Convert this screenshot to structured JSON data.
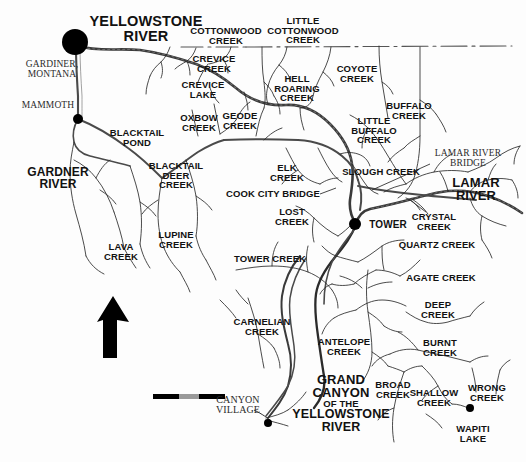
{
  "map": {
    "title": "Yellowstone River drainage map",
    "background_color": "#fdfdfd",
    "ink_color": "#111111",
    "river_color": "#333333",
    "road_color": "#555555",
    "north_arrow_label": "",
    "scale_bar": {
      "segments": [
        "#000000",
        "#9a9a9a",
        "#000000"
      ]
    },
    "places": [
      {
        "name": "gardiner-dot",
        "x": 75,
        "y": 42,
        "r": 13
      },
      {
        "name": "mammoth-dot",
        "x": 78,
        "y": 119,
        "r": 5
      },
      {
        "name": "tower-dot",
        "x": 355,
        "y": 224,
        "r": 6
      },
      {
        "name": "canyon-village-dot",
        "x": 268,
        "y": 423,
        "r": 4
      },
      {
        "name": "wapiti-lake-dot",
        "x": 470,
        "y": 408,
        "r": 4
      }
    ],
    "labels": [
      {
        "id": "yellowstone-river",
        "text": "YELLOWSTONE\nRIVER",
        "x": 146,
        "y": 29,
        "size": 14.5,
        "style": "big",
        "align": "center"
      },
      {
        "id": "gardiner-montana",
        "text": "GARDINER,\nMONTANA",
        "x": 52,
        "y": 70,
        "size": 9.5,
        "style": "serif",
        "align": "center"
      },
      {
        "id": "mammoth",
        "text": "MAMMOTH",
        "x": 48,
        "y": 106,
        "size": 9.5,
        "style": "serif",
        "align": "center"
      },
      {
        "id": "gardner-river",
        "text": "GARDNER\nRIVER",
        "x": 58,
        "y": 178,
        "size": 12,
        "style": "big",
        "align": "center"
      },
      {
        "id": "cottonwood-creek",
        "text": "COTTONWOOD\nCREEK",
        "x": 226,
        "y": 36,
        "size": 9.5,
        "style": "bold",
        "align": "center"
      },
      {
        "id": "little-cottonwood-creek",
        "text": "LITTLE\nCOTTONWOOD\nCREEK",
        "x": 303,
        "y": 31,
        "size": 9.5,
        "style": "bold",
        "align": "center"
      },
      {
        "id": "crevice-creek",
        "text": "CREVICE\nCREEK",
        "x": 214,
        "y": 64,
        "size": 9.5,
        "style": "bold",
        "align": "center"
      },
      {
        "id": "crevice-lake",
        "text": "CREVICE\nLAKE",
        "x": 203,
        "y": 90,
        "size": 9.5,
        "style": "bold",
        "align": "center"
      },
      {
        "id": "hell-roaring-creek",
        "text": "HELL\nROARING\nCREEK",
        "x": 297,
        "y": 89,
        "size": 9.5,
        "style": "bold",
        "align": "center"
      },
      {
        "id": "coyote-creek",
        "text": "COYOTE\nCREEK",
        "x": 357,
        "y": 74,
        "size": 9.5,
        "style": "bold",
        "align": "center"
      },
      {
        "id": "buffalo-creek",
        "text": "BUFFALO\nCREEK",
        "x": 409,
        "y": 111,
        "size": 9.5,
        "style": "bold",
        "align": "center"
      },
      {
        "id": "little-buffalo-creek",
        "text": "LITTLE\nBUFFALO\nCREEK",
        "x": 374,
        "y": 131,
        "size": 9.5,
        "style": "bold",
        "align": "center"
      },
      {
        "id": "oxbow-creek",
        "text": "OXBOW\nCREEK",
        "x": 199,
        "y": 123,
        "size": 9.5,
        "style": "bold",
        "align": "center"
      },
      {
        "id": "geode-creek",
        "text": "GEODE\nCREEK",
        "x": 240,
        "y": 121,
        "size": 9.5,
        "style": "bold",
        "align": "center"
      },
      {
        "id": "blacktail-pond",
        "text": "BLACKTAIL\nPOND",
        "x": 137,
        "y": 138,
        "size": 9.5,
        "style": "bold",
        "align": "center"
      },
      {
        "id": "blacktail-deer-creek",
        "text": "BLACKTAIL\nDEER\nCREEK",
        "x": 176,
        "y": 176,
        "size": 9.5,
        "style": "bold",
        "align": "center"
      },
      {
        "id": "elk-creek",
        "text": "ELK\nCREEK",
        "x": 287,
        "y": 173,
        "size": 9.5,
        "style": "bold",
        "align": "center"
      },
      {
        "id": "slough-creek",
        "text": "SLOUGH CREEK",
        "x": 381,
        "y": 172,
        "size": 9.5,
        "style": "bold",
        "align": "center"
      },
      {
        "id": "lamar-river-bridge",
        "text": "LAMAR RIVER\nBRIDGE",
        "x": 468,
        "y": 159,
        "size": 9.5,
        "style": "serif",
        "align": "center"
      },
      {
        "id": "lamar-river",
        "text": "LAMAR\nRIVER",
        "x": 476,
        "y": 189,
        "size": 13,
        "style": "big",
        "align": "center"
      },
      {
        "id": "cook-city-bridge",
        "text": "COOK CITY BRIDGE",
        "x": 273,
        "y": 194,
        "size": 9.5,
        "style": "bold",
        "align": "center"
      },
      {
        "id": "lost-creek",
        "text": "LOST\nCREEK",
        "x": 292,
        "y": 217,
        "size": 9.5,
        "style": "bold",
        "align": "center"
      },
      {
        "id": "tower",
        "text": "TOWER",
        "x": 388,
        "y": 225,
        "size": 10,
        "style": "bold",
        "align": "center"
      },
      {
        "id": "crystal-creek",
        "text": "CRYSTAL\nCREEK",
        "x": 434,
        "y": 222,
        "size": 9.5,
        "style": "bold",
        "align": "center"
      },
      {
        "id": "quartz-creek",
        "text": "QUARTZ CREEK",
        "x": 437,
        "y": 245,
        "size": 9.5,
        "style": "bold",
        "align": "center"
      },
      {
        "id": "lava-creek",
        "text": "LAVA\nCREEK",
        "x": 121,
        "y": 252,
        "size": 9.5,
        "style": "bold",
        "align": "center"
      },
      {
        "id": "lupine-creek",
        "text": "LUPINE\nCREEK",
        "x": 176,
        "y": 240,
        "size": 9.5,
        "style": "bold",
        "align": "center"
      },
      {
        "id": "tower-creek",
        "text": "TOWER CREEK",
        "x": 270,
        "y": 259,
        "size": 9.5,
        "style": "bold",
        "align": "center"
      },
      {
        "id": "agate-creek",
        "text": "AGATE CREEK",
        "x": 441,
        "y": 278,
        "size": 9.5,
        "style": "bold",
        "align": "center"
      },
      {
        "id": "deep-creek",
        "text": "DEEP\nCREEK",
        "x": 438,
        "y": 310,
        "size": 9.5,
        "style": "bold",
        "align": "center"
      },
      {
        "id": "carnelian-creek",
        "text": "CARNELIAN\nCREEK",
        "x": 262,
        "y": 327,
        "size": 9.5,
        "style": "bold",
        "align": "center"
      },
      {
        "id": "antelope-creek",
        "text": "ANTELOPE\nCREEK",
        "x": 344,
        "y": 347,
        "size": 9.5,
        "style": "bold",
        "align": "center"
      },
      {
        "id": "burnt-creek",
        "text": "BURNT\nCREEK",
        "x": 440,
        "y": 348,
        "size": 9.5,
        "style": "bold",
        "align": "center"
      },
      {
        "id": "grand-canyon",
        "text": "GRAND\nCANYON",
        "x": 341,
        "y": 386,
        "size": 13,
        "style": "big",
        "align": "center"
      },
      {
        "id": "grand-canyon-of-the",
        "text": "OF THE",
        "x": 341,
        "y": 404,
        "size": 9.5,
        "style": "bold",
        "align": "center"
      },
      {
        "id": "grand-canyon-yellowstone",
        "text": "YELLOWSTONE\nRIVER",
        "x": 341,
        "y": 421,
        "size": 12.5,
        "style": "big",
        "align": "center"
      },
      {
        "id": "broad-creek",
        "text": "BROAD\nCREEK",
        "x": 393,
        "y": 390,
        "size": 9.5,
        "style": "bold",
        "align": "center"
      },
      {
        "id": "shallow-creek",
        "text": "SHALLOW\nCREEK",
        "x": 434,
        "y": 398,
        "size": 9.5,
        "style": "bold",
        "align": "center"
      },
      {
        "id": "wrong-creek",
        "text": "WRONG\nCREEK",
        "x": 487,
        "y": 393,
        "size": 9.5,
        "style": "bold",
        "align": "center"
      },
      {
        "id": "wapiti-lake",
        "text": "WAPITI\nLAKE",
        "x": 473,
        "y": 434,
        "size": 9.5,
        "style": "bold",
        "align": "center"
      },
      {
        "id": "canyon-village",
        "text": "CANYON\nVILLAGE",
        "x": 238,
        "y": 405,
        "size": 10,
        "style": "serif",
        "align": "center"
      }
    ]
  }
}
